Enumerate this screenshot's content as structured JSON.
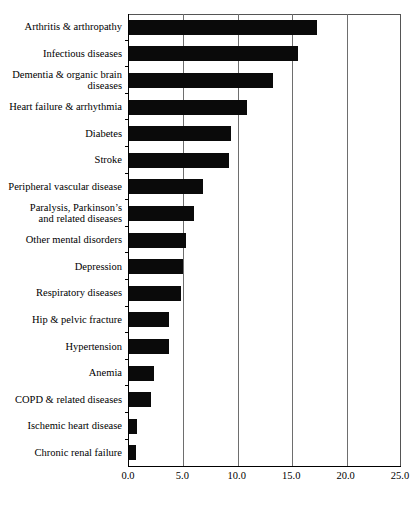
{
  "chart_data": {
    "type": "bar",
    "orientation": "horizontal",
    "title": "",
    "xlabel": "",
    "ylabel": "",
    "xlim": [
      0.0,
      25.0
    ],
    "xticks": [
      "0.0",
      "5.0",
      "10.0",
      "15.0",
      "20.0",
      "25.0"
    ],
    "xtick_values": [
      0.0,
      5.0,
      10.0,
      15.0,
      20.0,
      25.0
    ],
    "grid": true,
    "grid_axis": "x",
    "legend": false,
    "bar_color": "#0a0a0a",
    "categories": [
      "Arthritis & arthropathy",
      "Infectious diseases",
      "Dementia & organic brain\ndiseases",
      "Heart failure & arrhythmia",
      "Diabetes",
      "Stroke",
      "Peripheral vascular disease",
      "Paralysis, Parkinson’s\nand related diseases",
      "Other mental disorders",
      "Depression",
      "Respiratory diseases",
      "Hip & pelvic fracture",
      "Hypertension",
      "Anemia",
      "COPD & related diseases",
      "Ischemic heart disease",
      "Chronic renal failure"
    ],
    "values": [
      17.3,
      15.5,
      13.2,
      10.8,
      9.4,
      9.2,
      6.8,
      6.0,
      5.2,
      5.0,
      4.8,
      3.7,
      3.7,
      2.3,
      2.0,
      0.7,
      0.6
    ]
  }
}
